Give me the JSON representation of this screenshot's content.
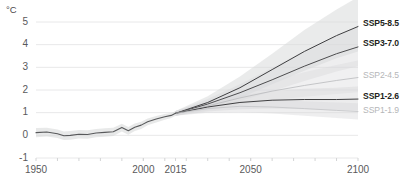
{
  "chart_data": {
    "type": "line",
    "title": "",
    "subtitle": "",
    "xlabel": "",
    "ylabel": "",
    "unit_label": "°C",
    "xlim": [
      1950,
      2100
    ],
    "ylim": [
      -1,
      5
    ],
    "grid": true,
    "legend_position": "right-inline",
    "x_tick_labels": [
      "1950",
      "2000",
      "2015",
      "2050",
      "2100"
    ],
    "x_tick_values": [
      1950,
      2000,
      2015,
      2050,
      2100
    ],
    "y_tick_labels": [
      "5",
      "4",
      "3",
      "2",
      "1",
      "0",
      "-1"
    ],
    "y_tick_values": [
      5,
      4,
      3,
      2,
      1,
      0,
      -1
    ],
    "minor_x_tick_values": [
      1960,
      1970,
      1980,
      1990,
      2000,
      2010,
      2020,
      2030,
      2040,
      2050,
      2060,
      2070,
      2080,
      2090
    ],
    "annotations": [
      "SSP5-8.5",
      "SSP3-7.0",
      "SSP2-4.5",
      "SSP1-2.6",
      "SSP1-1.9"
    ],
    "historical": {
      "name": "historical",
      "color": "#58595b",
      "x": [
        1950,
        1955,
        1960,
        1963,
        1966,
        1970,
        1974,
        1978,
        1982,
        1986,
        1990,
        1993,
        1996,
        1999,
        2002,
        2006,
        2010,
        2013,
        2015
      ],
      "values": [
        0.12,
        0.15,
        0.07,
        -0.02,
        0.0,
        0.05,
        0.04,
        0.1,
        0.13,
        0.16,
        0.35,
        0.2,
        0.36,
        0.45,
        0.6,
        0.72,
        0.82,
        0.88,
        0.97
      ],
      "band_upper": [
        0.32,
        0.34,
        0.26,
        0.17,
        0.19,
        0.23,
        0.22,
        0.28,
        0.31,
        0.33,
        0.51,
        0.37,
        0.52,
        0.6,
        0.74,
        0.85,
        0.94,
        0.99,
        1.07
      ],
      "band_lower": [
        -0.08,
        -0.05,
        -0.12,
        -0.21,
        -0.19,
        -0.14,
        -0.15,
        -0.09,
        -0.06,
        -0.03,
        0.17,
        0.03,
        0.19,
        0.28,
        0.44,
        0.57,
        0.69,
        0.76,
        0.86
      ]
    },
    "series": [
      {
        "name": "SSP5-8.5",
        "color": "#3f3f41",
        "label_style": "strong",
        "x": [
          2015,
          2030,
          2045,
          2060,
          2075,
          2090,
          2100
        ],
        "values": [
          0.97,
          1.45,
          2.1,
          2.9,
          3.7,
          4.4,
          4.8
        ],
        "band_upper": [
          1.07,
          1.72,
          2.6,
          3.6,
          4.65,
          5.55,
          6.1
        ],
        "band_lower": [
          0.86,
          1.2,
          1.65,
          2.25,
          2.85,
          3.4,
          3.7
        ]
      },
      {
        "name": "SSP3-7.0",
        "color": "#4d4d4f",
        "label_style": "strong",
        "x": [
          2015,
          2030,
          2045,
          2060,
          2075,
          2090,
          2100
        ],
        "values": [
          0.97,
          1.38,
          1.88,
          2.45,
          3.05,
          3.6,
          3.9
        ],
        "band_upper": [
          1.07,
          1.6,
          2.25,
          2.98,
          3.72,
          4.4,
          4.8
        ],
        "band_lower": [
          0.86,
          1.15,
          1.52,
          1.95,
          2.4,
          2.82,
          3.05
        ]
      },
      {
        "name": "SSP2-4.5",
        "color": "#b9babc",
        "label_style": "faint",
        "x": [
          2015,
          2030,
          2045,
          2060,
          2075,
          2090,
          2100
        ],
        "values": [
          0.97,
          1.3,
          1.65,
          1.95,
          2.2,
          2.42,
          2.55
        ],
        "band_upper": [
          1.07,
          1.5,
          1.98,
          2.4,
          2.78,
          3.1,
          3.3
        ],
        "band_lower": [
          0.86,
          1.1,
          1.35,
          1.55,
          1.7,
          1.82,
          1.9
        ]
      },
      {
        "name": "SSP1-2.6",
        "color": "#3f3f41",
        "label_style": "strong",
        "x": [
          2015,
          2030,
          2045,
          2060,
          2075,
          2090,
          2100
        ],
        "values": [
          0.97,
          1.25,
          1.45,
          1.55,
          1.58,
          1.58,
          1.6
        ],
        "band_upper": [
          1.07,
          1.45,
          1.75,
          1.95,
          2.05,
          2.1,
          2.15
        ],
        "band_lower": [
          0.86,
          1.05,
          1.15,
          1.18,
          1.15,
          1.1,
          1.08
        ]
      },
      {
        "name": "SSP1-1.9",
        "color": "#c3c4c6",
        "label_style": "faint",
        "x": [
          2015,
          2030,
          2045,
          2060,
          2075,
          2090,
          2100
        ],
        "values": [
          0.97,
          1.18,
          1.28,
          1.25,
          1.18,
          1.1,
          1.05
        ],
        "band_upper": [
          1.07,
          1.35,
          1.52,
          1.55,
          1.5,
          1.45,
          1.42
        ],
        "band_lower": [
          0.86,
          1.0,
          1.02,
          0.96,
          0.86,
          0.76,
          0.7
        ]
      }
    ]
  },
  "axis": {
    "unit": "°C",
    "y_labels": [
      "5",
      "4",
      "3",
      "2",
      "1",
      "0",
      "-1"
    ],
    "x_labels": [
      "1950",
      "2000",
      "2015",
      "2050",
      "2100"
    ]
  },
  "legend": {
    "items": [
      {
        "label": "SSP5-8.5",
        "style": "strong"
      },
      {
        "label": "SSP3-7.0",
        "style": "strong"
      },
      {
        "label": "SSP2-4.5",
        "style": "faint"
      },
      {
        "label": "SSP1-2.6",
        "style": "strong"
      },
      {
        "label": "SSP1-1.9",
        "style": "faint"
      }
    ]
  },
  "colors": {
    "grid": "#e8e8e9",
    "axis_text": "#59595b",
    "line_dark": "#3f3f41",
    "line_mid": "#6d6e70",
    "line_faint": "#c3c4c6",
    "band": "#d9dadb",
    "background": "#ffffff"
  }
}
